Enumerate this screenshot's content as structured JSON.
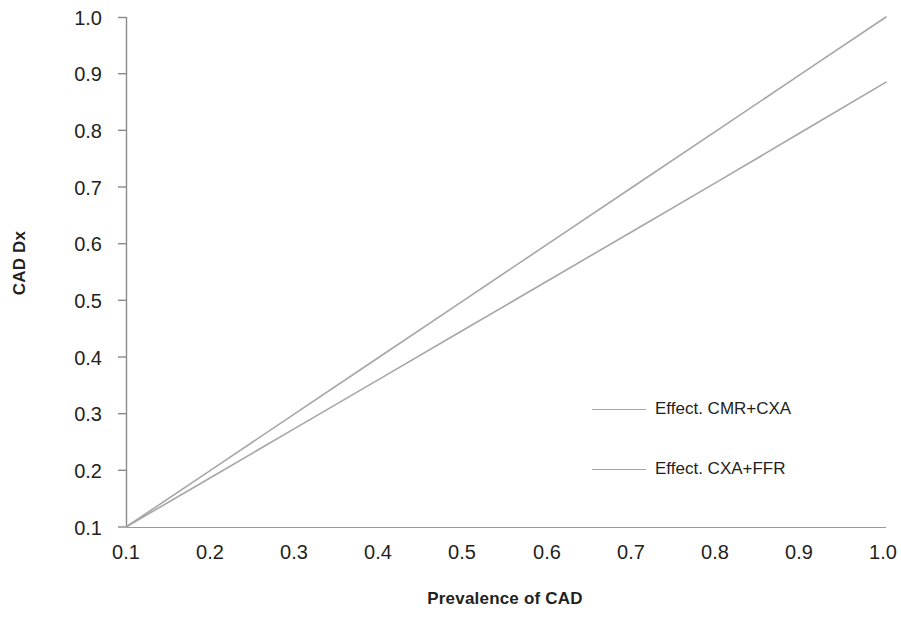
{
  "chart_data": {
    "type": "line",
    "title": "",
    "subtitle": "",
    "xlabel": "Prevalence of CAD",
    "ylabel": "CAD Dx",
    "xlim": [
      0.1,
      1.0
    ],
    "ylim": [
      0.1,
      1.0
    ],
    "xticks": [
      "0.1",
      "0.2",
      "0.3",
      "0.4",
      "0.5",
      "0.6",
      "0.7",
      "0.8",
      "0.9",
      "1.0"
    ],
    "yticks": [
      "0.1",
      "0.2",
      "0.3",
      "0.4",
      "0.5",
      "0.6",
      "0.7",
      "0.8",
      "0.9",
      "1.0"
    ],
    "grid": false,
    "legend_position": "center-right",
    "x": [
      0.1,
      0.2,
      0.3,
      0.4,
      0.5,
      0.6,
      0.7,
      0.8,
      0.9,
      1.0
    ],
    "series": [
      {
        "name": "Effect. CMR+CXA",
        "color": "#a6a6a6",
        "values": [
          0.1,
          0.2,
          0.3,
          0.4,
          0.5,
          0.6,
          0.7,
          0.8,
          0.9,
          1.0
        ]
      },
      {
        "name": "Effect. CXA+FFR",
        "color": "#a6a6a6",
        "values": [
          0.1,
          0.187,
          0.274,
          0.361,
          0.448,
          0.535,
          0.622,
          0.709,
          0.797,
          0.885
        ]
      }
    ]
  },
  "axes": {
    "x_title": "Prevalence of CAD",
    "y_title": "CAD Dx",
    "x_tick_labels": [
      "0.1",
      "0.2",
      "0.3",
      "0.4",
      "0.5",
      "0.6",
      "0.7",
      "0.8",
      "0.9",
      "1.0"
    ],
    "y_tick_labels": [
      "1.0",
      "0.9",
      "0.8",
      "0.7",
      "0.6",
      "0.5",
      "0.4",
      "0.3",
      "0.2",
      "0.1"
    ],
    "axis_color": "#808080"
  },
  "legend": {
    "entries": [
      {
        "label": "Effect. CMR+CXA",
        "color": "#a6a6a6"
      },
      {
        "label": "Effect. CXA+FFR",
        "color": "#a6a6a6"
      }
    ]
  }
}
